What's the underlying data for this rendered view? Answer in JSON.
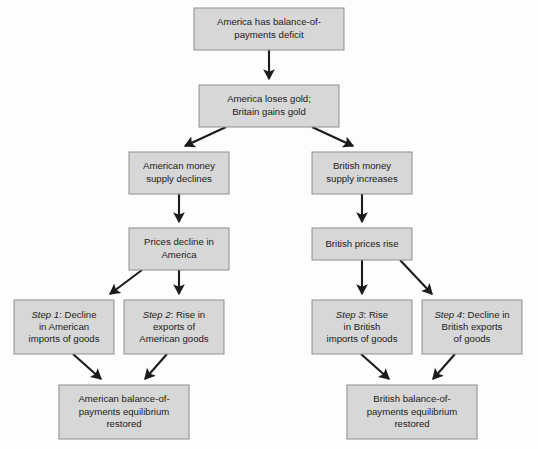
{
  "diagram": {
    "background_color": "#fdfdfd",
    "node_fill_color": "#d7d7d7",
    "node_border_color": "#8d8d8d",
    "edge_color": "#1b1b1b",
    "text_color": "#1b1b1b"
  },
  "nodes": {
    "deficit": {
      "name": "america-deficit",
      "lines": [
        "America has balance-of-",
        "payments deficit"
      ],
      "x": 194,
      "y": 8,
      "w": 150,
      "h": 42
    },
    "gold": {
      "name": "gold-flow",
      "lines": [
        "America loses gold;",
        "Britain gains gold"
      ],
      "x": 199,
      "y": 85,
      "w": 140,
      "h": 42
    },
    "us_money": {
      "name": "american-money-supply",
      "lines": [
        "American money",
        "supply declines"
      ],
      "x": 129,
      "y": 152,
      "w": 100,
      "h": 42
    },
    "uk_money": {
      "name": "british-money-supply",
      "lines": [
        "British money",
        "supply increases"
      ],
      "x": 312,
      "y": 152,
      "w": 100,
      "h": 42
    },
    "us_prices": {
      "name": "american-prices-decline",
      "lines": [
        "Prices decline in",
        "America"
      ],
      "x": 129,
      "y": 228,
      "w": 100,
      "h": 42
    },
    "uk_prices": {
      "name": "british-prices-rise",
      "lines": [
        "British prices rise"
      ],
      "x": 312,
      "y": 228,
      "w": 100,
      "h": 32
    },
    "step1": {
      "name": "step-1-american-imports",
      "step": "Step 1",
      "lines": [
        ": Decline",
        "in American",
        "imports of goods"
      ],
      "x": 14,
      "y": 300,
      "w": 100,
      "h": 54
    },
    "step2": {
      "name": "step-2-american-exports",
      "step": "Step 2",
      "lines": [
        ": Rise in",
        "exports of",
        "American goods"
      ],
      "x": 124,
      "y": 300,
      "w": 100,
      "h": 54
    },
    "step3": {
      "name": "step-3-british-imports",
      "step": "Step 3",
      "lines": [
        ": Rise",
        "in British",
        "imports of goods"
      ],
      "x": 312,
      "y": 300,
      "w": 100,
      "h": 54
    },
    "step4": {
      "name": "step-4-british-exports",
      "step": "Step 4",
      "lines": [
        ": Decline in",
        "British exports",
        "of goods"
      ],
      "x": 422,
      "y": 300,
      "w": 100,
      "h": 54
    },
    "us_equilibrium": {
      "name": "american-equilibrium-restored",
      "lines": [
        "American balance-of-",
        "payments equilibrium",
        "restored"
      ],
      "x": 59,
      "y": 385,
      "w": 130,
      "h": 54
    },
    "uk_equilibrium": {
      "name": "british-equilibrium-restored",
      "lines": [
        "British balance-of-",
        "payments equilibrium",
        "restored"
      ],
      "x": 347,
      "y": 385,
      "w": 130,
      "h": 54
    }
  },
  "edges": [
    {
      "name": "edge-deficit-to-gold",
      "from": "deficit",
      "to": "gold",
      "path": "M 269,50 L 269,79"
    },
    {
      "name": "edge-gold-to-us-money",
      "from": "gold",
      "to": "us_money",
      "path": "M 226,127 L 185,146"
    },
    {
      "name": "edge-gold-to-uk-money",
      "from": "gold",
      "to": "uk_money",
      "path": "M 312,127 L 353,146"
    },
    {
      "name": "edge-us-money-to-us-prices",
      "from": "us_money",
      "to": "us_prices",
      "path": "M 179,194 L 179,222"
    },
    {
      "name": "edge-uk-money-to-uk-prices",
      "from": "uk_money",
      "to": "uk_prices",
      "path": "M 362,194 L 362,222"
    },
    {
      "name": "edge-us-prices-to-step1",
      "from": "us_prices",
      "to": "step1",
      "path": "M 142,270 L 110,294"
    },
    {
      "name": "edge-us-prices-to-step2",
      "from": "us_prices",
      "to": "step2",
      "path": "M 179,270 L 179,294"
    },
    {
      "name": "edge-uk-prices-to-step3",
      "from": "uk_prices",
      "to": "step3",
      "path": "M 362,260 L 362,294"
    },
    {
      "name": "edge-uk-prices-to-step4",
      "from": "uk_prices",
      "to": "step4",
      "path": "M 400,260 L 432,294"
    },
    {
      "name": "edge-step1-to-us-equilibrium",
      "from": "step1",
      "to": "us_equilibrium",
      "path": "M 73,354 L 101,379"
    },
    {
      "name": "edge-step2-to-us-equilibrium",
      "from": "step2",
      "to": "us_equilibrium",
      "path": "M 167,354 L 145,379"
    },
    {
      "name": "edge-step3-to-uk-equilibrium",
      "from": "step3",
      "to": "uk_equilibrium",
      "path": "M 361,354 L 389,379"
    },
    {
      "name": "edge-step4-to-uk-equilibrium",
      "from": "step4",
      "to": "uk_equilibrium",
      "path": "M 455,354 L 433,379"
    }
  ]
}
